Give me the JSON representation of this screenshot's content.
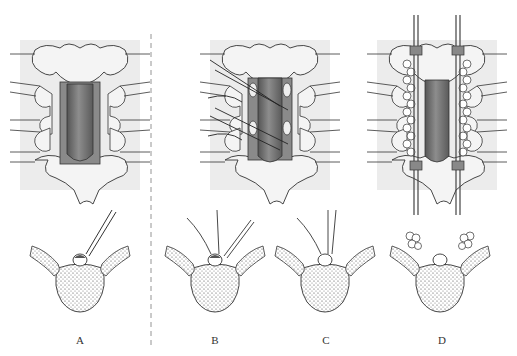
{
  "figure": {
    "panels": [
      {
        "id": "A",
        "label": "A"
      },
      {
        "id": "B",
        "label": "B"
      },
      {
        "id": "C",
        "label": "C"
      },
      {
        "id": "D",
        "label": "D"
      }
    ],
    "colors": {
      "bone": "#f2f2f2",
      "outline": "#333333",
      "dura": "#7a7a7a",
      "dura_dark": "#555555",
      "background_band": "#e6e6e6",
      "divider": "#888888"
    }
  }
}
